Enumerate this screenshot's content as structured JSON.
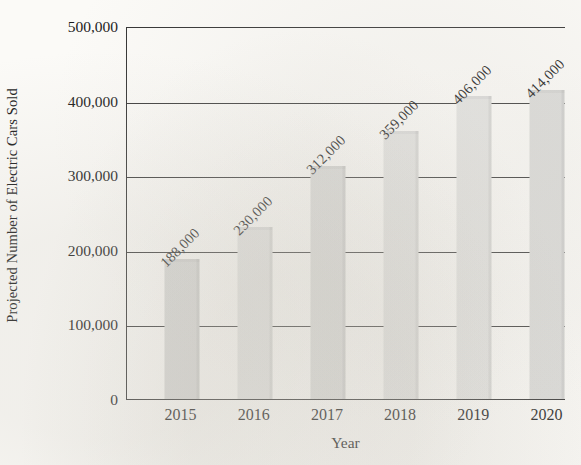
{
  "chart_data": {
    "type": "bar",
    "title": "",
    "xlabel": "Year",
    "ylabel": "Projected Number of Electric Cars Sold",
    "categories": [
      "2015",
      "2016",
      "2017",
      "2018",
      "2019",
      "2020"
    ],
    "values": [
      188000,
      230000,
      312000,
      359000,
      406000,
      414000
    ],
    "data_labels": [
      "188,000",
      "230,000",
      "312,000",
      "359,000",
      "406,000",
      "414,000"
    ],
    "ylim": [
      0,
      500000
    ],
    "y_ticks": [
      0,
      100000,
      200000,
      300000,
      400000,
      500000
    ],
    "y_tick_labels": [
      "0",
      "100,000",
      "200,000",
      "300,000",
      "400,000",
      "500,000"
    ],
    "grid": true,
    "grid_axis": "y",
    "legend": null,
    "legend_position": "none",
    "data_label_rotation": -45,
    "bar_color": "#dedede",
    "axis_color": "#333333",
    "background_color": "#fbfaf7"
  }
}
